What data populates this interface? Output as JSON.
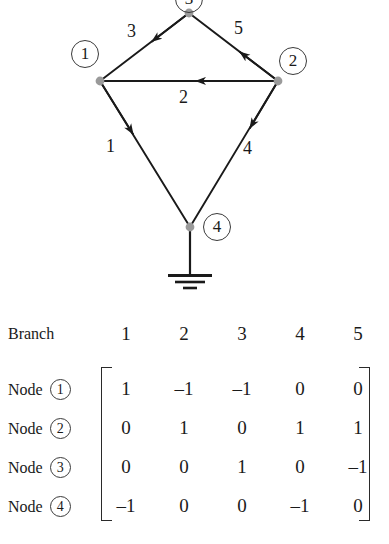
{
  "figure": {
    "type": "circuit-incidence-graph",
    "nodes": [
      {
        "id": "1",
        "label": "1",
        "dot": [
          100,
          81
        ],
        "label_pos": [
          71,
          40
        ]
      },
      {
        "id": "2",
        "label": "2",
        "dot": [
          278,
          81
        ],
        "label_pos": [
          279,
          47
        ]
      },
      {
        "id": "3",
        "label": "3",
        "dot": [
          189,
          13
        ],
        "label_pos": [
          175,
          -14
        ]
      },
      {
        "id": "4",
        "label": "4",
        "dot": [
          190,
          227
        ],
        "label_pos": [
          203,
          213
        ]
      }
    ],
    "branches": [
      {
        "id": "1",
        "label": "1",
        "from": "1",
        "to": "4",
        "label_pos": [
          113,
          139
        ]
      },
      {
        "id": "2",
        "label": "2",
        "from": "2",
        "to": "1",
        "label_pos": [
          179,
          88
        ]
      },
      {
        "id": "3",
        "label": "3",
        "from": "3",
        "to": "1",
        "label_pos": [
          127,
          22
        ]
      },
      {
        "id": "4",
        "label": "4",
        "from": "2",
        "to": "4",
        "label_pos": [
          243,
          140
        ]
      },
      {
        "id": "5",
        "label": "5",
        "from": "2",
        "to": "3",
        "label_pos": [
          234,
          20
        ]
      }
    ],
    "ground": {
      "attached_node": "4",
      "name": "ground-symbol"
    }
  },
  "matrix": {
    "corner_label": "Branch",
    "row_prefix": "Node",
    "column_headers": [
      "1",
      "2",
      "3",
      "4",
      "5"
    ],
    "row_labels": [
      "1",
      "2",
      "3",
      "4"
    ],
    "rows": [
      [
        "1",
        "–1",
        "–1",
        "0",
        "0"
      ],
      [
        "0",
        "1",
        "0",
        "1",
        "1"
      ],
      [
        "0",
        "0",
        "1",
        "0",
        "–1"
      ],
      [
        "–1",
        "0",
        "0",
        "–1",
        "0"
      ]
    ]
  },
  "colors": {
    "ink": "#1a1a1a",
    "line": "#2a2a2a",
    "node_dot": "#9a9a9a",
    "background": "#ffffff"
  }
}
